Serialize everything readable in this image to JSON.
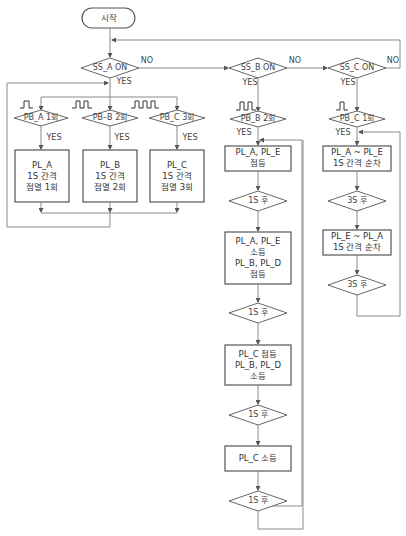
{
  "flowchart": {
    "start": "시작",
    "labels": {
      "yes": "YES",
      "no": "NO"
    },
    "mode_a": {
      "decision": "SS_A ON",
      "branches": [
        {
          "decision": "PB_A 1회",
          "pulses": 1,
          "process": "PL_A\n1S 간격\n점멸 1회"
        },
        {
          "decision": "PB–B 2회",
          "pulses": 2,
          "process": "PL_B\n1S 간격\n점멸 2회"
        },
        {
          "decision": "PB_C 3회",
          "pulses": 3,
          "process": "PL_C\n1S 간격\n점멸 3회"
        }
      ]
    },
    "mode_b": {
      "decision": "SS_B ON",
      "trigger": "PB_B 2회",
      "pulses": 2,
      "steps": [
        {
          "type": "process",
          "text": "PL_A, PL_E\n점등"
        },
        {
          "type": "decision",
          "text": "1S 후"
        },
        {
          "type": "process",
          "text": "PL_A, PL_E\n소등\nPL_B, PL_D\n점등"
        },
        {
          "type": "decision",
          "text": "1S 후"
        },
        {
          "type": "process",
          "text": "PL_C 점등\nPL_B, PL_D\n소등"
        },
        {
          "type": "decision",
          "text": "1S 후"
        },
        {
          "type": "process",
          "text": "PL_C 소등"
        },
        {
          "type": "decision",
          "text": "1S 후"
        }
      ]
    },
    "mode_c": {
      "decision": "SS_C ON",
      "trigger": "PB_C 1회",
      "pulses": 1,
      "steps": [
        {
          "type": "process",
          "text": "PL_A ~ PL_E\n1S 간격 순차"
        },
        {
          "type": "decision",
          "text": "3S 후"
        },
        {
          "type": "process",
          "text": "PL_E ~ PL_A\n1S 간격 순차"
        },
        {
          "type": "decision",
          "text": "3S 후"
        }
      ]
    }
  }
}
